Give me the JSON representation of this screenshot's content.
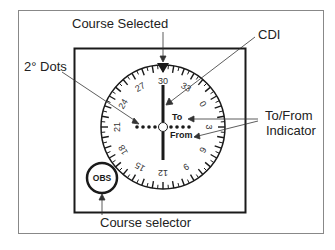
{
  "labels": {
    "course_selected": "Course Selected",
    "cdi": "CDI",
    "dots": "2° Dots",
    "to_from_1": "To/From",
    "to_from_2": "Indicator",
    "course_selector": "Course selector"
  },
  "instrument": {
    "to_label": "To",
    "from_label": "From",
    "obs_label": "OBS",
    "selected_course": "30",
    "compass_numbers": [
      "30",
      "33",
      "0",
      "3",
      "6",
      "9",
      "12",
      "15",
      "18",
      "21",
      "24",
      "27"
    ]
  },
  "colors": {
    "ink": "#1a1a1a",
    "frame": "#888888",
    "background": "#ffffff"
  }
}
